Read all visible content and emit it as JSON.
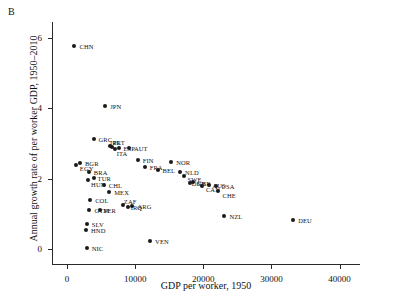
{
  "panel": {
    "letter": "B"
  },
  "chart_data": {
    "type": "scatter",
    "title": "",
    "xlabel": "GDP per worker, 1950",
    "ylabel": "Annual growth rate of per worker GDP, 1950–2010",
    "xlim": [
      -2200,
      43000
    ],
    "ylim": [
      -0.45,
      6.45
    ],
    "xticks": [
      0,
      10000,
      20000,
      30000,
      40000
    ],
    "xticklabels": [
      "0",
      "10000",
      "20000",
      "30000",
      "40000"
    ],
    "yticks": [
      0,
      2,
      4,
      6
    ],
    "yticklabels": [
      "0",
      "2",
      "4",
      "6"
    ],
    "grid": false,
    "legend": false,
    "marker": "filled-circle",
    "points": [
      {
        "label": "CHN",
        "x": 1100,
        "y": 5.78,
        "lx": 5,
        "ly": 0
      },
      {
        "label": "JPN",
        "x": 5600,
        "y": 4.07,
        "lx": 5,
        "ly": 0
      },
      {
        "label": "GRC",
        "x": 3900,
        "y": 3.12,
        "lx": 5,
        "ly": 0
      },
      {
        "label": "ESP",
        "x": 7700,
        "y": 2.88,
        "lx": 4,
        "ly": 0
      },
      {
        "label": "PRT",
        "x": 6300,
        "y": 2.92,
        "lx": 3,
        "ly": -4
      },
      {
        "label": "ITA",
        "x": 7000,
        "y": 2.84,
        "lx": 2,
        "ly": 4
      },
      {
        "label": "IRL",
        "x": 6600,
        "y": 2.9,
        "lx": -2,
        "ly": -5
      },
      {
        "label": "AUT",
        "x": 9100,
        "y": 2.86,
        "lx": 5,
        "ly": 0
      },
      {
        "label": "FIN",
        "x": 10400,
        "y": 2.52,
        "lx": 5,
        "ly": 0
      },
      {
        "label": "NOR",
        "x": 15300,
        "y": 2.48,
        "lx": 5,
        "ly": 0
      },
      {
        "label": "FRA",
        "x": 11400,
        "y": 2.33,
        "lx": 5,
        "ly": 0
      },
      {
        "label": "BEL",
        "x": 13300,
        "y": 2.25,
        "lx": 5,
        "ly": 0
      },
      {
        "label": "NLD",
        "x": 16600,
        "y": 2.18,
        "lx": 5,
        "ly": 0
      },
      {
        "label": "SWE",
        "x": 17100,
        "y": 2.08,
        "lx": 4,
        "ly": 3
      },
      {
        "label": "GBR",
        "x": 18500,
        "y": 1.92,
        "lx": 4,
        "ly": 1
      },
      {
        "label": "DNK",
        "x": 18000,
        "y": 1.88,
        "lx": 2,
        "ly": 0
      },
      {
        "label": "CAN",
        "x": 19800,
        "y": 1.78,
        "lx": 4,
        "ly": 3
      },
      {
        "label": "AUS",
        "x": 20900,
        "y": 1.82,
        "lx": 3,
        "ly": 0
      },
      {
        "label": "USA",
        "x": 21900,
        "y": 1.8,
        "lx": 5,
        "ly": 0
      },
      {
        "label": "CHE",
        "x": 22100,
        "y": 1.66,
        "lx": 5,
        "ly": 4
      },
      {
        "label": "NZL",
        "x": 23100,
        "y": 0.94,
        "lx": 5,
        "ly": 0
      },
      {
        "label": "DEU",
        "x": 33200,
        "y": 0.82,
        "lx": 5,
        "ly": 0
      },
      {
        "label": "BGR",
        "x": 1900,
        "y": 2.45,
        "lx": 5,
        "ly": 0
      },
      {
        "label": "EGY",
        "x": 1300,
        "y": 2.38,
        "lx": 4,
        "ly": 3
      },
      {
        "label": "BRA",
        "x": 3200,
        "y": 2.2,
        "lx": 5,
        "ly": 0
      },
      {
        "label": "TUR",
        "x": 3900,
        "y": 2.03,
        "lx": 4,
        "ly": 0
      },
      {
        "label": "HUN",
        "x": 3100,
        "y": 1.96,
        "lx": 3,
        "ly": 4
      },
      {
        "label": "CHL",
        "x": 5400,
        "y": 1.82,
        "lx": 5,
        "ly": 0
      },
      {
        "label": "MEX",
        "x": 6200,
        "y": 1.62,
        "lx": 5,
        "ly": 0
      },
      {
        "label": "COL",
        "x": 3400,
        "y": 1.4,
        "lx": 5,
        "ly": 0
      },
      {
        "label": "ARG",
        "x": 9600,
        "y": 1.22,
        "lx": 5,
        "ly": 0
      },
      {
        "label": "IRQ",
        "x": 8900,
        "y": 1.2,
        "lx": 3,
        "ly": 0
      },
      {
        "label": "ZAF",
        "x": 8200,
        "y": 1.24,
        "lx": 1,
        "ly": -4
      },
      {
        "label": "GTM",
        "x": 3300,
        "y": 1.12,
        "lx": 5,
        "ly": 0
      },
      {
        "label": "PER",
        "x": 4800,
        "y": 1.12,
        "lx": 4,
        "ly": 0
      },
      {
        "label": "SLV",
        "x": 2900,
        "y": 0.72,
        "lx": 5,
        "ly": 0
      },
      {
        "label": "HND",
        "x": 2800,
        "y": 0.55,
        "lx": 5,
        "ly": 0
      },
      {
        "label": "NIC",
        "x": 2900,
        "y": 0.02,
        "lx": 5,
        "ly": 0
      },
      {
        "label": "VEN",
        "x": 12200,
        "y": 0.22,
        "lx": 5,
        "ly": 0
      }
    ]
  }
}
